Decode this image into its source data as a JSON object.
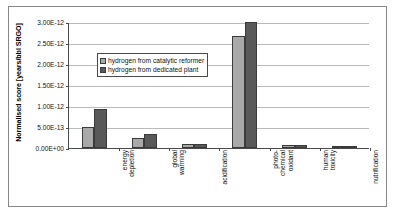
{
  "chart_data": {
    "type": "bar",
    "title": "",
    "xlabel": "",
    "ylabel": "Normalised score [years/bbl SRGO]",
    "ylim": [
      0,
      3e-12
    ],
    "grid": true,
    "legend_position": "inside-top-left",
    "categories": [
      "energy depletion",
      "global warming",
      "acidification",
      "photo-chemical oxidant",
      "human toxicity",
      "nutrification"
    ],
    "category_lines": [
      [
        "energy",
        "depletion"
      ],
      [
        "global",
        "warming"
      ],
      [
        "acidification"
      ],
      [
        "photo-",
        "chemical",
        "oxidant"
      ],
      [
        "human",
        "toxicity"
      ],
      [
        "nutrification"
      ]
    ],
    "ytick_labels": [
      "0.00E+00",
      "5.00E-13",
      "1.00E-12",
      "1.50E-12",
      "2.00E-12",
      "2.50E-12",
      "3.00E-12"
    ],
    "ytick_values": [
      0,
      5e-13,
      1e-12,
      1.5e-12,
      2e-12,
      2.5e-12,
      3e-12
    ],
    "series": [
      {
        "name": "hydrogen from catalytic reformer",
        "color": "#a9a9a9",
        "values": [
          5e-13,
          2.4e-13,
          9.5e-14,
          2.67e-12,
          7.5e-14,
          1.5e-14
        ]
      },
      {
        "name": "hydrogen from dedicated plant",
        "color": "#595959",
        "values": [
          9.4e-13,
          3.3e-13,
          1.05e-13,
          3e-12,
          7.5e-14,
          1.5e-14
        ]
      }
    ]
  },
  "legend": {
    "items": [
      {
        "label": "hydrogen from catalytic reformer"
      },
      {
        "label": "hydrogen from dedicated plant"
      }
    ]
  },
  "axes": {
    "y_title": "Normalised score [years/bbl SRGO]"
  },
  "colors": {
    "series_light": "#a9a9a9",
    "series_dark": "#595959",
    "axis": "#4a4a4a",
    "grid": "#b9b9b9",
    "frame": "#888888",
    "background": "#ffffff"
  }
}
